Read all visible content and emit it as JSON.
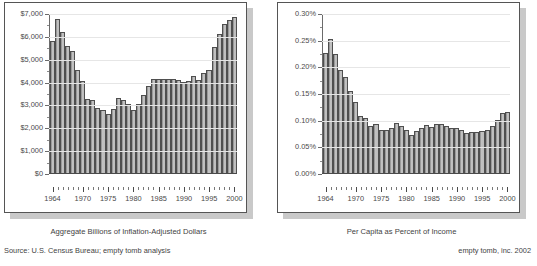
{
  "captions": {
    "left": "Aggregate Billions of Inflation-Adjusted Dollars",
    "right": "Per Capita as Percent of Income",
    "source": "Source: U.S. Census Bureau; empty tomb analysis",
    "credit": "empty tomb, inc. 2002"
  },
  "chart_data": [
    {
      "id": "aggregate-dollars",
      "type": "bar",
      "title": "",
      "xlabel": "",
      "ylabel": "",
      "caption": "Aggregate Billions of Inflation-Adjusted Dollars",
      "grid": true,
      "legend": null,
      "ylim": [
        0,
        7000
      ],
      "yticks": [
        0,
        1000,
        2000,
        3000,
        4000,
        5000,
        6000,
        7000
      ],
      "ytick_labels": [
        "$0",
        "$1,000",
        "$2,000",
        "$3,000",
        "$4,000",
        "$5,000",
        "$6,000",
        "$7,000"
      ],
      "xtick_labels": [
        "1964",
        "1970",
        "1975",
        "1980",
        "1985",
        "1990",
        "1995",
        "2000"
      ],
      "categories": [
        "1964",
        "1965",
        "1966",
        "1967",
        "1968",
        "1969",
        "1970",
        "1971",
        "1972",
        "1973",
        "1974",
        "1975",
        "1976",
        "1977",
        "1978",
        "1979",
        "1980",
        "1981",
        "1982",
        "1983",
        "1984",
        "1985",
        "1986",
        "1987",
        "1988",
        "1989",
        "1990",
        "1991",
        "1992",
        "1993",
        "1994",
        "1995",
        "1996",
        "1997",
        "1998",
        "1999",
        "2000"
      ],
      "values": [
        5800,
        6780,
        6220,
        5600,
        5350,
        4550,
        4050,
        3270,
        3200,
        2850,
        2790,
        2600,
        2820,
        3320,
        3230,
        3040,
        2770,
        3020,
        3450,
        3850,
        4150,
        4120,
        4140,
        4160,
        4150,
        4110,
        4000,
        4060,
        4280,
        4100,
        4400,
        4520,
        5530,
        6120,
        6580,
        6720,
        6850
      ]
    },
    {
      "id": "per-capita-percent-income",
      "type": "bar",
      "title": "",
      "xlabel": "",
      "ylabel": "",
      "caption": "Per Capita as Percent of Income",
      "grid": true,
      "legend": null,
      "ylim": [
        0,
        0.3
      ],
      "yticks": [
        0,
        0.05,
        0.1,
        0.15,
        0.2,
        0.25,
        0.3
      ],
      "ytick_labels": [
        "0.00%",
        "0.05%",
        "0.10%",
        "0.15%",
        "0.20%",
        "0.25%",
        "0.30%"
      ],
      "xtick_labels": [
        "1964",
        "1970",
        "1975",
        "1980",
        "1985",
        "1990",
        "1995",
        "2000"
      ],
      "categories": [
        "1964",
        "1965",
        "1966",
        "1967",
        "1968",
        "1969",
        "1970",
        "1971",
        "1972",
        "1973",
        "1974",
        "1975",
        "1976",
        "1977",
        "1978",
        "1979",
        "1980",
        "1981",
        "1982",
        "1983",
        "1984",
        "1985",
        "1986",
        "1987",
        "1988",
        "1989",
        "1990",
        "1991",
        "1992",
        "1993",
        "1994",
        "1995",
        "1996",
        "1997",
        "1998",
        "1999",
        "2000"
      ],
      "values": [
        0.2265,
        0.253,
        0.224,
        0.195,
        0.182,
        0.1545,
        0.134,
        0.1075,
        0.1045,
        0.0895,
        0.0925,
        0.0805,
        0.0805,
        0.0855,
        0.094,
        0.0895,
        0.081,
        0.0725,
        0.079,
        0.0855,
        0.09,
        0.0875,
        0.0925,
        0.093,
        0.088,
        0.0855,
        0.084,
        0.081,
        0.075,
        0.0765,
        0.078,
        0.08,
        0.0805,
        0.089,
        0.0995,
        0.1125,
        0.1145
      ]
    }
  ]
}
